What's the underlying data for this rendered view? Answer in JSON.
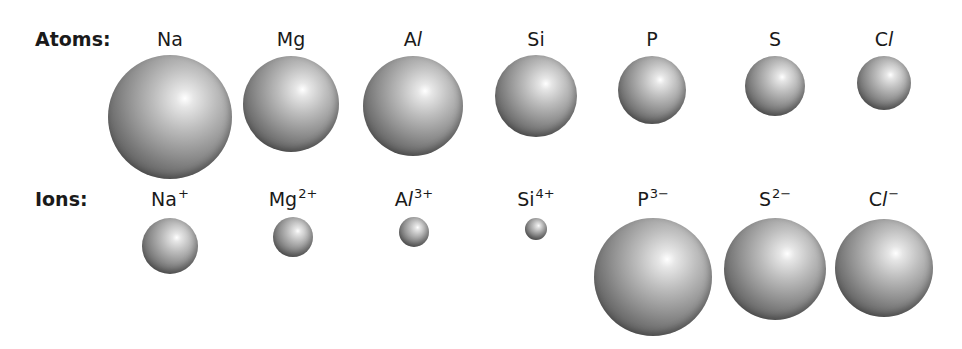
{
  "rows": {
    "atoms": {
      "label": "Atoms:",
      "items": [
        {
          "base": "Na",
          "italic": "",
          "charge": "",
          "cx": 170,
          "cy": 117,
          "r": 62,
          "label_y": 30
        },
        {
          "base": "Mg",
          "italic": "",
          "charge": "",
          "cx": 291,
          "cy": 104,
          "r": 48,
          "label_y": 30
        },
        {
          "base": "A",
          "italic": "l",
          "charge": "",
          "cx": 413,
          "cy": 106,
          "r": 50,
          "label_y": 30
        },
        {
          "base": "Si",
          "italic": "",
          "charge": "",
          "cx": 536,
          "cy": 96,
          "r": 41,
          "label_y": 30
        },
        {
          "base": "P",
          "italic": "",
          "charge": "",
          "cx": 652,
          "cy": 90,
          "r": 34,
          "label_y": 30
        },
        {
          "base": "S",
          "italic": "",
          "charge": "",
          "cx": 775,
          "cy": 86,
          "r": 30,
          "label_y": 30
        },
        {
          "base": "C",
          "italic": "l",
          "charge": "",
          "cx": 884,
          "cy": 83,
          "r": 27,
          "label_y": 30
        }
      ]
    },
    "ions": {
      "label": "Ions:",
      "items": [
        {
          "base": "Na",
          "italic": "",
          "charge": "+",
          "cx": 170,
          "cy": 246,
          "r": 28,
          "label_y": 190
        },
        {
          "base": "Mg",
          "italic": "",
          "charge": "2+",
          "cx": 293,
          "cy": 237,
          "r": 20,
          "label_y": 190
        },
        {
          "base": "A",
          "italic": "l",
          "charge": "3+",
          "cx": 414,
          "cy": 232,
          "r": 15,
          "label_y": 190
        },
        {
          "base": "Si",
          "italic": "",
          "charge": "4+",
          "cx": 536,
          "cy": 229,
          "r": 11,
          "label_y": 190
        },
        {
          "base": "P",
          "italic": "",
          "charge": "3−",
          "cx": 653,
          "cy": 277,
          "r": 59,
          "label_y": 190
        },
        {
          "base": "S",
          "italic": "",
          "charge": "2−",
          "cx": 775,
          "cy": 269,
          "r": 51,
          "label_y": 190
        },
        {
          "base": "C",
          "italic": "l",
          "charge": "−",
          "cx": 884,
          "cy": 268,
          "r": 49,
          "label_y": 190
        }
      ]
    }
  },
  "colors": {
    "text": "#1a1a1a",
    "sphere_highlight": "#ffffff",
    "sphere_shadow": "#2c2c2c",
    "background": "#ffffff"
  }
}
